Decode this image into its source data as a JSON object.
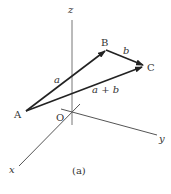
{
  "figure": {
    "caption": "(a)",
    "axes": {
      "x_label": "x",
      "y_label": "y",
      "z_label": "z",
      "origin_label": "O"
    },
    "points": {
      "A": "A",
      "B": "B",
      "C": "C"
    },
    "vectors": [
      {
        "name": "a",
        "label": "a",
        "from": "A",
        "to": "B"
      },
      {
        "name": "b",
        "label": "b",
        "from": "B",
        "to": "C"
      },
      {
        "name": "a_plus_b",
        "label": "a + b",
        "from": "A",
        "to": "C"
      }
    ],
    "colors": {
      "axis": "#666666",
      "vector": "#222222",
      "text": "#333333"
    }
  }
}
